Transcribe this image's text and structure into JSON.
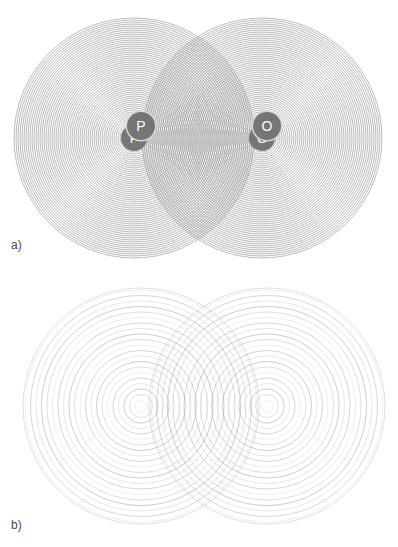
{
  "figure": {
    "kind": "two-source circular wave interference diagram",
    "background_color": "#ffffff",
    "wave_color": "#8c8c8c",
    "marker_fill_color": "#757575",
    "marker_text_color": "#ffffff",
    "label_color": "#4a4a4a",
    "width": 398,
    "height": 547
  },
  "panels": [
    {
      "id": "panel-a",
      "label": "a)",
      "description": "Short-wavelength case: densely spaced concentric wavefronts from both sources producing a fine lens-shaped interference region between them.",
      "geometry": {
        "center_y": 138,
        "radius": 120,
        "ring_spacing": 2.0,
        "ring_count": 60,
        "stroke_width": 0.7,
        "stroke_opacity": 0.85
      },
      "sources": [
        {
          "name": "P",
          "label": "P",
          "cx": 134,
          "cy": 138,
          "marker_diameter": 26,
          "font_size": 13
        },
        {
          "name": "O",
          "label": "O",
          "cx": 262,
          "cy": 138,
          "marker_diameter": 26,
          "font_size": 13
        }
      ]
    },
    {
      "id": "panel-b",
      "label": "b)",
      "description": "Long-wavelength case: widely spaced concentric wavefronts with varying line weight producing a coarse interference pattern between the sources.",
      "geometry": {
        "center_y": 126,
        "radius": 118,
        "ring_spacing": 5.5,
        "ring_count": 22,
        "stroke_width": 0.8,
        "stroke_opacity": 0.55
      },
      "sources": [
        {
          "name": "P",
          "label": "P",
          "cx": 141,
          "cy": 126,
          "marker_diameter": 28,
          "font_size": 14
        },
        {
          "name": "O",
          "label": "O",
          "cx": 267,
          "cy": 126,
          "marker_diameter": 28,
          "font_size": 14
        }
      ]
    }
  ],
  "chart_data": {
    "type": "scatter",
    "title": "",
    "xlabel": "",
    "ylabel": "",
    "series": [
      {
        "name": "panel-a-source-P",
        "center": [
          134,
          138
        ],
        "wavefront_radii": [
          2,
          4,
          6,
          8,
          10,
          12,
          14,
          16,
          18,
          20,
          22,
          24,
          26,
          28,
          30,
          32,
          34,
          36,
          38,
          40,
          42,
          44,
          46,
          48,
          50,
          52,
          54,
          56,
          58,
          60,
          62,
          64,
          66,
          68,
          70,
          72,
          74,
          76,
          78,
          80,
          82,
          84,
          86,
          88,
          90,
          92,
          94,
          96,
          98,
          100,
          102,
          104,
          106,
          108,
          110,
          112,
          114,
          116,
          118,
          120
        ]
      },
      {
        "name": "panel-a-source-O",
        "center": [
          262,
          138
        ],
        "wavefront_radii": [
          2,
          4,
          6,
          8,
          10,
          12,
          14,
          16,
          18,
          20,
          22,
          24,
          26,
          28,
          30,
          32,
          34,
          36,
          38,
          40,
          42,
          44,
          46,
          48,
          50,
          52,
          54,
          56,
          58,
          60,
          62,
          64,
          66,
          68,
          70,
          72,
          74,
          76,
          78,
          80,
          82,
          84,
          86,
          88,
          90,
          92,
          94,
          96,
          98,
          100,
          102,
          104,
          106,
          108,
          110,
          112,
          114,
          116,
          118,
          120
        ]
      },
      {
        "name": "panel-b-source-P",
        "center": [
          141,
          406
        ],
        "wavefront_radii": [
          6,
          11.5,
          17,
          22.5,
          28,
          33.5,
          39,
          44.5,
          50,
          55.5,
          61,
          66.5,
          72,
          77.5,
          83,
          88.5,
          94,
          99.5,
          105,
          110.5,
          116,
          118
        ]
      },
      {
        "name": "panel-b-source-O",
        "center": [
          267,
          406
        ],
        "wavefront_radii": [
          6,
          11.5,
          17,
          22.5,
          28,
          33.5,
          39,
          44.5,
          50,
          55.5,
          61,
          66.5,
          72,
          77.5,
          83,
          88.5,
          94,
          99.5,
          105,
          110.5,
          116,
          118
        ]
      }
    ],
    "annotations": [
      {
        "text": "P",
        "x": 134,
        "y": 138
      },
      {
        "text": "O",
        "x": 262,
        "y": 138
      },
      {
        "text": "a)",
        "x": 11,
        "y": 239
      },
      {
        "text": "P",
        "x": 141,
        "y": 406
      },
      {
        "text": "O",
        "x": 267,
        "y": 406
      },
      {
        "text": "b)",
        "x": 11,
        "y": 519
      }
    ]
  }
}
